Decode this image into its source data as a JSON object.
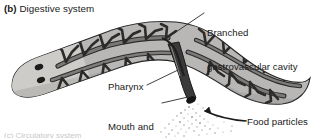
{
  "figure": {
    "panel_tag": "(b)",
    "panel_title": "Digestive system",
    "organism": "planarian-flatworm",
    "background_color": "#ffffff",
    "ink_color": "#1a1a1a"
  },
  "labels": {
    "gastrovascular_line1": "Branched",
    "gastrovascular_line2": "gastrovascular cavity",
    "pharynx": "Pharynx",
    "mouth_anus_line1": "Mouth and",
    "mouth_anus_line2": "anus",
    "food_particles": "Food particles"
  },
  "anatomy": {
    "body_fill": "#b9b8b6",
    "head_fill": "#cfcecc",
    "gut_fill": "#6e6d6b",
    "gut_outline": "#2b2b2b",
    "pharynx_fill": "#3a3a3a",
    "eyespot_fill": "#1c1c1c",
    "outline": "#262626",
    "particle_color": "#9a9a9a",
    "eyespot_count": 2,
    "gut_branch_count": 18
  },
  "leaders": {
    "gastrovascular": "diagonal-down-left",
    "pharynx": "horizontal-right",
    "mouth_anus": "diagonal-up-right",
    "food_particles": "curved-arrow-up-left"
  },
  "bottom_bleed_text": "(c) Circulatory system"
}
